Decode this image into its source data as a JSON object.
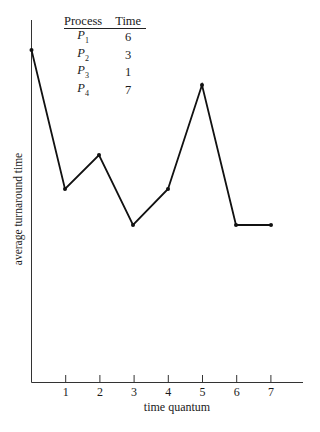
{
  "chart_data": {
    "type": "line",
    "title": "",
    "xlabel": "time quantum",
    "ylabel": "average turnaround time",
    "x": [
      0,
      1,
      2,
      3,
      4,
      5,
      6,
      7
    ],
    "x_tick_labels": [
      "1",
      "2",
      "3",
      "4",
      "5",
      "6",
      "7"
    ],
    "series": [
      {
        "name": "average turnaround time",
        "values": [
          12.9,
          11.0,
          11.5,
          10.5,
          11.0,
          12.4,
          10.5,
          10.5
        ]
      }
    ],
    "y_ticks": "none",
    "grid": false,
    "legend": "none",
    "inset_table": {
      "headers": [
        "Process",
        "Time"
      ],
      "rows": [
        [
          "P1",
          "6"
        ],
        [
          "P2",
          "3"
        ],
        [
          "P3",
          "1"
        ],
        [
          "P4",
          "7"
        ]
      ]
    }
  },
  "table": {
    "headers": [
      "Process",
      "Time"
    ],
    "rows": [
      {
        "name": "P",
        "sub": "1",
        "time": "6"
      },
      {
        "name": "P",
        "sub": "2",
        "time": "3"
      },
      {
        "name": "P",
        "sub": "3",
        "time": "1"
      },
      {
        "name": "P",
        "sub": "4",
        "time": "7"
      }
    ]
  },
  "axis": {
    "xlabel": "time quantum",
    "ylabel": "average turnaround time",
    "ticks": [
      "1",
      "2",
      "3",
      "4",
      "5",
      "6",
      "7"
    ]
  },
  "pixel_points": [
    [
      31.5,
      50
    ],
    [
      65,
      189
    ],
    [
      99,
      155
    ],
    [
      133,
      225
    ],
    [
      168,
      189
    ],
    [
      202,
      85
    ],
    [
      236,
      225
    ],
    [
      271,
      225
    ]
  ]
}
